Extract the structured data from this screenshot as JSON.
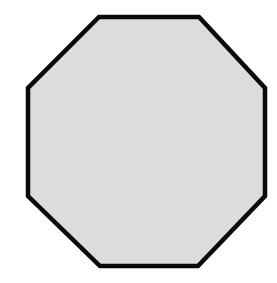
{
  "canvas": {
    "width": 277,
    "height": 283,
    "background_color": "#FFFFFF",
    "title": "Octagon"
  },
  "shape": {
    "name": "octagon",
    "sides": 8,
    "label": "Regular octagon outline",
    "fill_color": "#DCDCDC",
    "stroke_color": "#0A0A0A",
    "stroke_width": 4.5,
    "points": "99,17 199,17 265,88 265,196 198,266 100,266 28,196 28,88",
    "vertices": [
      {
        "name": "top-left",
        "x": 99,
        "y": 17
      },
      {
        "name": "top-right",
        "x": 199,
        "y": 17
      },
      {
        "name": "right-top",
        "x": 265,
        "y": 88
      },
      {
        "name": "right-bottom",
        "x": 265,
        "y": 196
      },
      {
        "name": "bottom-right",
        "x": 198,
        "y": 266
      },
      {
        "name": "bottom-left",
        "x": 100,
        "y": 266
      },
      {
        "name": "left-bottom",
        "x": 28,
        "y": 196
      },
      {
        "name": "left-top",
        "x": 28,
        "y": 88
      }
    ]
  }
}
